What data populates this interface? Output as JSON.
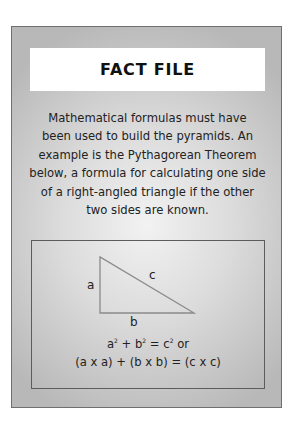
{
  "fact_file": {
    "title": "FACT FILE",
    "body_lines": [
      "Mathematical formulas must have",
      "been used to build the pyramids. An",
      "example is the Pythagorean Theorem",
      "below, a formula for calculating one side",
      "of a right-angled triangle if the other",
      "two sides are known."
    ],
    "diagram": {
      "icon": "right-triangle-icon",
      "labels": {
        "a": "a",
        "b": "b",
        "c": "c"
      },
      "formula_line1": {
        "a": "a",
        "a_exp": "2",
        "plus": " + ",
        "b": "b",
        "b_exp": "2",
        "equals": " = ",
        "c": "c",
        "c_exp": "2",
        "suffix": " or"
      },
      "formula_line2": "(a x a) + (b x b) = (c x c)"
    }
  },
  "colors": {
    "box_border": "#6f6f6f",
    "box_center": "#f2f2f2",
    "box_edge": "#b8b8b8",
    "title_bg": "#ffffff",
    "text": "#222222"
  }
}
